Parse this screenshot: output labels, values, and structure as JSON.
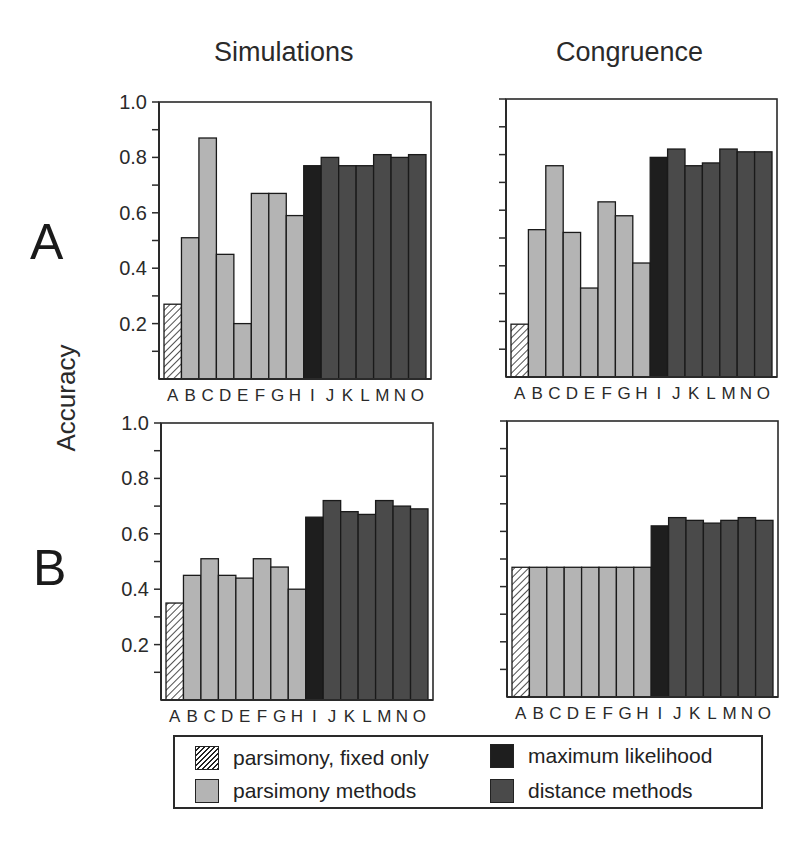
{
  "columns": [
    "Simulations",
    "Congruence"
  ],
  "rows": [
    "A",
    "B"
  ],
  "y_axis_title": "Accuracy",
  "categories": [
    "A",
    "B",
    "C",
    "D",
    "E",
    "F",
    "G",
    "H",
    "I",
    "J",
    "K",
    "L",
    "M",
    "N",
    "O"
  ],
  "category_groups": [
    "fixed",
    "pars",
    "pars",
    "pars",
    "pars",
    "pars",
    "pars",
    "pars",
    "ml",
    "dist",
    "dist",
    "dist",
    "dist",
    "dist",
    "dist"
  ],
  "y_ticks_labeled": [
    "1.0",
    "0.8",
    "0.6",
    "0.4",
    "0.2"
  ],
  "colors": {
    "fixed": "#ffffff",
    "pars": "#b4b4b4",
    "ml": "#1e1e1e",
    "dist": "#4a4a4a",
    "outline": "#1a1a1a",
    "axis": "#2a2a2a"
  },
  "legend": {
    "items": [
      {
        "key": "fixed",
        "label": "parsimony, fixed only"
      },
      {
        "key": "ml",
        "label": "maximum likelihood"
      },
      {
        "key": "pars",
        "label": "parsimony methods"
      },
      {
        "key": "dist",
        "label": "distance methods"
      }
    ]
  },
  "chart_data": [
    {
      "type": "bar",
      "title": "Simulations",
      "row": "A",
      "xlabel": "",
      "ylabel": "Accuracy",
      "ylim": [
        0,
        1.0
      ],
      "categories": [
        "A",
        "B",
        "C",
        "D",
        "E",
        "F",
        "G",
        "H",
        "I",
        "J",
        "K",
        "L",
        "M",
        "N",
        "O"
      ],
      "values": [
        0.27,
        0.51,
        0.87,
        0.45,
        0.2,
        0.67,
        0.67,
        0.59,
        0.77,
        0.8,
        0.77,
        0.77,
        0.81,
        0.8,
        0.81
      ]
    },
    {
      "type": "bar",
      "title": "Congruence",
      "row": "A",
      "xlabel": "",
      "ylabel": "Accuracy",
      "ylim": [
        0,
        1.0
      ],
      "categories": [
        "A",
        "B",
        "C",
        "D",
        "E",
        "F",
        "G",
        "H",
        "I",
        "J",
        "K",
        "L",
        "M",
        "N",
        "O"
      ],
      "values": [
        0.19,
        0.53,
        0.76,
        0.52,
        0.32,
        0.63,
        0.58,
        0.41,
        0.79,
        0.82,
        0.76,
        0.77,
        0.82,
        0.81,
        0.81
      ]
    },
    {
      "type": "bar",
      "title": "Simulations",
      "row": "B",
      "xlabel": "",
      "ylabel": "Accuracy",
      "ylim": [
        0,
        1.0
      ],
      "categories": [
        "A",
        "B",
        "C",
        "D",
        "E",
        "F",
        "G",
        "H",
        "I",
        "J",
        "K",
        "L",
        "M",
        "N",
        "O"
      ],
      "values": [
        0.35,
        0.45,
        0.51,
        0.45,
        0.44,
        0.51,
        0.48,
        0.4,
        0.66,
        0.72,
        0.68,
        0.67,
        0.72,
        0.7,
        0.69
      ]
    },
    {
      "type": "bar",
      "title": "Congruence",
      "row": "B",
      "xlabel": "",
      "ylabel": "Accuracy",
      "ylim": [
        0,
        1.0
      ],
      "categories": [
        "A",
        "B",
        "C",
        "D",
        "E",
        "F",
        "G",
        "H",
        "I",
        "J",
        "K",
        "L",
        "M",
        "N",
        "O"
      ],
      "values": [
        0.47,
        0.47,
        0.47,
        0.47,
        0.47,
        0.47,
        0.47,
        0.47,
        0.62,
        0.65,
        0.64,
        0.63,
        0.64,
        0.65,
        0.64
      ]
    }
  ]
}
